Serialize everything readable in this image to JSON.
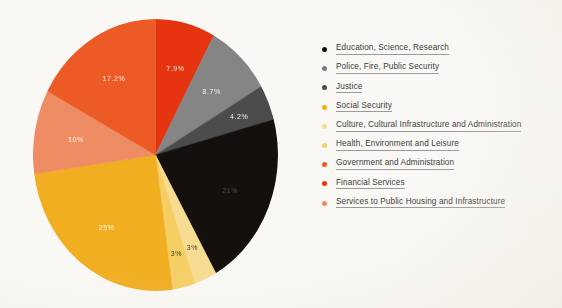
{
  "background_color": "#faf8f4",
  "chart_data": {
    "type": "pie",
    "title": "",
    "subtitle": "",
    "xlabel": "",
    "ylabel": "",
    "legend_position": "right",
    "grid": false,
    "start_angle_deg": 0,
    "direction": "clockwise",
    "categories": [
      "Education, Science, Research",
      "Police, Fire, Public Security",
      "Justice",
      "Social Security",
      "Culture, Cultural Infrastructure and Administration",
      "Health, Environment and Leisure",
      "Government and Administration",
      "Financial Services",
      "Services to Public Housing and Infrastructure"
    ],
    "values": [
      21,
      8.7,
      4.2,
      25,
      3,
      3,
      17.2,
      7.9,
      10
    ],
    "value_labels": [
      "21%",
      "8.7%",
      "4.2%",
      "25%",
      "3%",
      "3%",
      "17.2%",
      "7.9%",
      "10%"
    ],
    "colors": [
      "#120f0c",
      "#858585",
      "#4b4b4b",
      "#f2ae1e",
      "#f8dc90",
      "#f7cf63",
      "#ee5a24",
      "#e8330f",
      "#f08c63"
    ],
    "slices_clockwise_from_top": [
      {
        "label": "Financial Services",
        "value": 7.9,
        "display": "7.9%",
        "color": "#e8330f",
        "label_color": "light"
      },
      {
        "label": "Police, Fire, Public Security",
        "value": 8.7,
        "display": "8.7%",
        "color": "#858585",
        "label_color": "light"
      },
      {
        "label": "Justice",
        "value": 4.2,
        "display": "4.2%",
        "color": "#4b4b4b",
        "label_color": "light"
      },
      {
        "label": "Education, Science, Research",
        "value": 21,
        "display": "21%",
        "color": "#120f0c",
        "label_color": "faint"
      },
      {
        "label": "Culture, Cultural Infrastructure and Administration",
        "value": 3,
        "display": "3%",
        "color": "#f8dc90",
        "label_color": "dark"
      },
      {
        "label": "Health, Environment and Leisure",
        "value": 3,
        "display": "3%",
        "color": "#f7cf63",
        "label_color": "dark"
      },
      {
        "label": "Social Security",
        "value": 25,
        "display": "25%",
        "color": "#f2ae1e",
        "label_color": "light"
      },
      {
        "label": "Services to Public Housing and Infrastructure",
        "value": 10,
        "display": "10%",
        "color": "#f08c63",
        "label_color": "light"
      },
      {
        "label": "Government and Administration",
        "value": 17.2,
        "display": "17.2%",
        "color": "#ee5a24",
        "label_color": "light"
      }
    ]
  },
  "legend": {
    "items": [
      {
        "label": "Education, Science, Research",
        "color": "#120f0c"
      },
      {
        "label": "Police, Fire, Public Security",
        "color": "#7d7d7d"
      },
      {
        "label": "Justice",
        "color": "#4b4b4b"
      },
      {
        "label": "Social Security",
        "color": "#f2ae1e"
      },
      {
        "label": "Culture, Cultural Infrastructure and Administration",
        "color": "#f8dc90"
      },
      {
        "label": "Health, Environment and Leisure",
        "color": "#f7cf63"
      },
      {
        "label": "Government and Administration",
        "color": "#ee5a24"
      },
      {
        "label": "Financial Services",
        "color": "#e8330f"
      },
      {
        "label": "Services to Public Housing and Infrastructure",
        "color": "#f08c63"
      }
    ]
  }
}
